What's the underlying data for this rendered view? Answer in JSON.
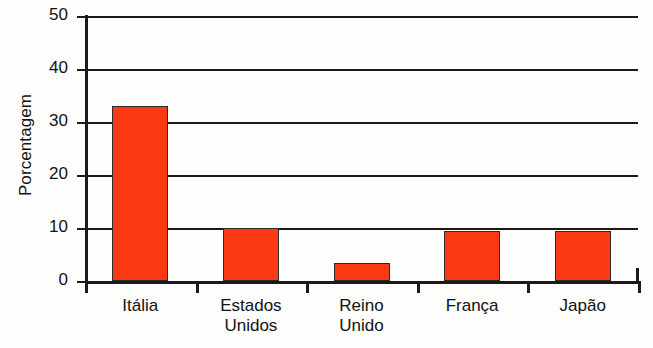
{
  "chart_data": {
    "type": "bar",
    "title": "",
    "subtitle": "",
    "xlabel": "",
    "ylabel": "Porcentagem",
    "categories": [
      "Itália",
      "Estados Unidos",
      "Reino Unido",
      "França",
      "Japão"
    ],
    "category_lines": [
      [
        "Itália"
      ],
      [
        "Estados",
        "Unidos"
      ],
      [
        "Reino",
        "Unido"
      ],
      [
        "França"
      ],
      [
        "Japão"
      ]
    ],
    "values": [
      33,
      10,
      3.4,
      9.4,
      9.4
    ],
    "ylim": [
      0,
      50
    ],
    "ytick_labels": [
      "0",
      "10",
      "20",
      "30",
      "40",
      "50"
    ],
    "ytick_values": [
      0,
      10,
      20,
      30,
      40,
      50
    ],
    "grid": true,
    "grid_axis": "y",
    "legend": "none",
    "bar_color": "#f93a13",
    "bar_outline_color": "#2b2b2b",
    "axis_color": "#1a1a1a",
    "background_color": "#fdfdfb"
  }
}
